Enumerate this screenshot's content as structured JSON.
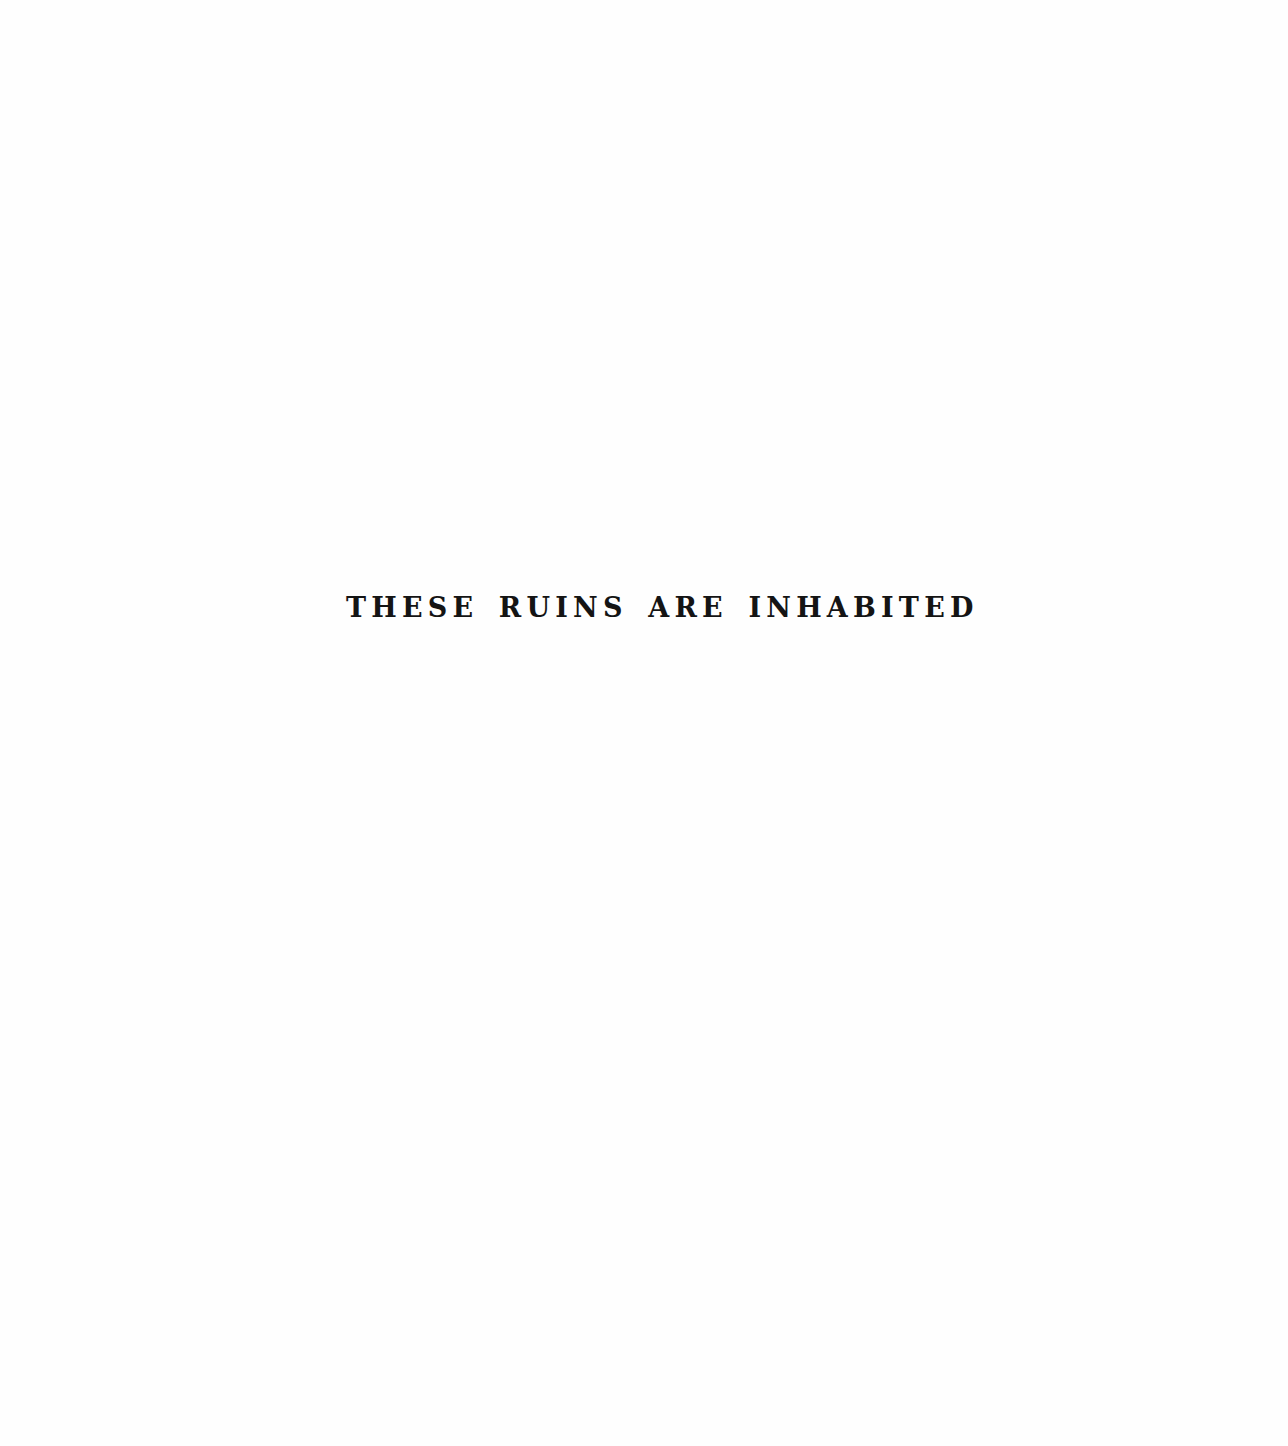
{
  "page": {
    "type": "half-title page",
    "half_title": "THESE RUINS ARE INHABITED",
    "text_color": "#141414",
    "background_color": "#fefefe"
  }
}
